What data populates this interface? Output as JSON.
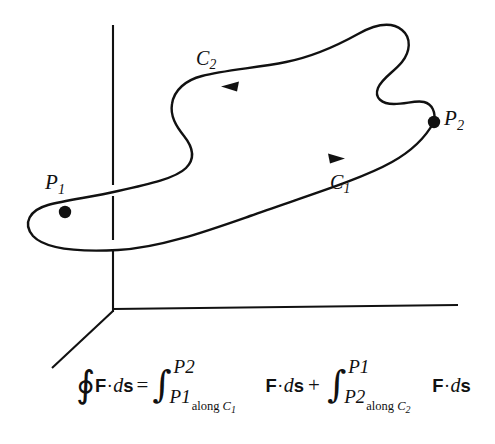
{
  "figure": {
    "background_color": "#ffffff",
    "ink_color": "#111111",
    "axes": {
      "name": "three-dimensional-coordinate-axes",
      "style": "thin black lines, origin at lower left",
      "origin": [
        113,
        312
      ],
      "vertical_axis_top": [
        113,
        25
      ],
      "horizontal_axis_end": [
        458,
        306
      ],
      "diagonal_axis_end": [
        52,
        368
      ]
    },
    "curve": {
      "name": "closed-space-curve",
      "description": "closed wavy loop passing through P1 and P2"
    },
    "points": [
      {
        "id": "P1",
        "label": "P",
        "subscript": "1",
        "x": 65,
        "y": 212,
        "label_x": 45,
        "label_y": 172
      },
      {
        "id": "P2",
        "label": "P",
        "subscript": "2",
        "x": 434,
        "y": 122,
        "label_x": 444,
        "label_y": 108
      }
    ],
    "path_labels": [
      {
        "id": "C1",
        "label": "C",
        "subscript": "1",
        "direction": "right",
        "arrow_x": 337,
        "arrow_y": 159
      },
      {
        "id": "C2",
        "label": "C",
        "subscript": "2",
        "direction": "left",
        "arrow_x": 229,
        "arrow_y": 85
      }
    ]
  },
  "formula": {
    "contour_symbol": "∮",
    "integral_symbol": "∫",
    "equals": "=",
    "plus": "+",
    "integrand": {
      "field": "F",
      "dot": "·",
      "differential": "d",
      "arc": "s"
    },
    "term1": {
      "upper_limit": "P",
      "upper_sub": "2",
      "lower_limit": "P",
      "lower_sub": "1",
      "along_text": "along",
      "along_curve": "C",
      "along_curve_sub": "1"
    },
    "term2": {
      "upper_limit": "P",
      "upper_sub": "1",
      "lower_limit": "P",
      "lower_sub": "2",
      "along_text": "along",
      "along_curve": "C",
      "along_curve_sub": "2"
    }
  }
}
